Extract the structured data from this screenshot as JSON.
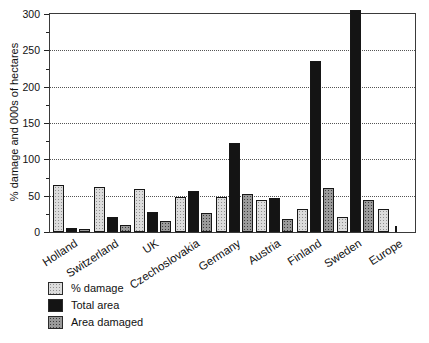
{
  "chart_data": {
    "type": "bar",
    "title": "",
    "xlabel": "",
    "ylabel": "% damage and 000s of hectares",
    "ylim": [
      0,
      300
    ],
    "ytick_major_step": 50,
    "ytick_minor_step": 25,
    "ytick_labels": [
      "0",
      "50",
      "100",
      "150",
      "200",
      "250",
      "300"
    ],
    "grid": "horizontal dotted lines at 50, 100, 150, 200, 250",
    "categories": [
      "Holland",
      "Switzerland",
      "UK",
      "Czechoslovakia",
      "Germany",
      "Austria",
      "Finland",
      "Sweden",
      "Europe"
    ],
    "series": [
      {
        "name": "% damage",
        "pattern": "light-stipple",
        "color": "#dcdcdc",
        "values": [
          65,
          62,
          59,
          48,
          48,
          44,
          32,
          21,
          31
        ]
      },
      {
        "name": "Total area",
        "pattern": "solid-black",
        "color": "#141414",
        "values": [
          5,
          20,
          28,
          56,
          122,
          47,
          235,
          305,
          8
        ]
      },
      {
        "name": "Area damaged",
        "pattern": "dark-stipple",
        "color": "#9a9a9a",
        "values": [
          4,
          10,
          15,
          26,
          52,
          18,
          60,
          44,
          0
        ]
      }
    ],
    "legend": {
      "position": "bottom-left",
      "entries": [
        "% damage",
        "Total area",
        "Area damaged"
      ]
    },
    "layout_hints": {
      "thin_bars": [
        {
          "category": "Europe",
          "series": "Total area"
        }
      ],
      "bar_outline_color": "#161616",
      "axis_color": "#3a3a3a"
    }
  }
}
